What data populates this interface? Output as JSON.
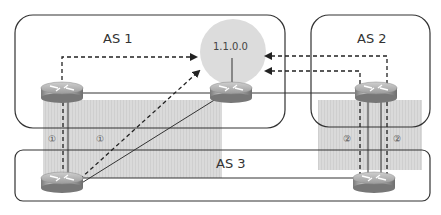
{
  "diagram": {
    "autonomous_systems": [
      {
        "id": "as1",
        "label": "AS 1"
      },
      {
        "id": "as2",
        "label": "AS 2"
      },
      {
        "id": "as3",
        "label": "AS 3"
      }
    ],
    "network": {
      "label": "1.1.0.0"
    },
    "steps": [
      {
        "label": "①"
      },
      {
        "label": "①"
      },
      {
        "label": "②"
      },
      {
        "label": "②"
      }
    ],
    "routers": [
      {
        "name": "as1-left-router"
      },
      {
        "name": "as1-right-router"
      },
      {
        "name": "as2-router"
      },
      {
        "name": "as3-left-router"
      },
      {
        "name": "as3-right-router"
      }
    ],
    "colors": {
      "box_stroke": "#333333",
      "shade": "#d9d9d9",
      "network_circle": "#dcdcdc",
      "line": "#333333"
    }
  }
}
